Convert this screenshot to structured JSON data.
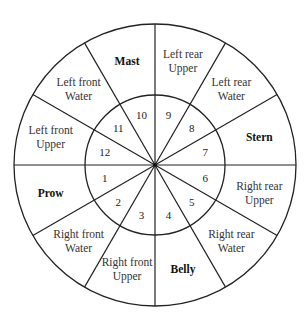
{
  "diagram": {
    "segments": [
      {
        "number": "1",
        "lines": [
          "Prow"
        ],
        "bold": true
      },
      {
        "number": "2",
        "lines": [
          "Right front",
          "Water"
        ],
        "bold": false
      },
      {
        "number": "3",
        "lines": [
          "Right front",
          "Upper"
        ],
        "bold": false
      },
      {
        "number": "4",
        "lines": [
          "Belly"
        ],
        "bold": true
      },
      {
        "number": "5",
        "lines": [
          "Right rear",
          "Water"
        ],
        "bold": false
      },
      {
        "number": "6",
        "lines": [
          "Right rear",
          "Upper"
        ],
        "bold": false
      },
      {
        "number": "7",
        "lines": [
          "Stern"
        ],
        "bold": true
      },
      {
        "number": "8",
        "lines": [
          "Left rear",
          "Water"
        ],
        "bold": false
      },
      {
        "number": "9",
        "lines": [
          "Left rear",
          "Upper"
        ],
        "bold": false
      },
      {
        "number": "10",
        "lines": [
          "Mast"
        ],
        "bold": true
      },
      {
        "number": "11",
        "lines": [
          "Left front",
          "Water"
        ],
        "bold": false
      },
      {
        "number": "12",
        "lines": [
          "Left front",
          "Upper"
        ],
        "bold": false
      }
    ]
  }
}
